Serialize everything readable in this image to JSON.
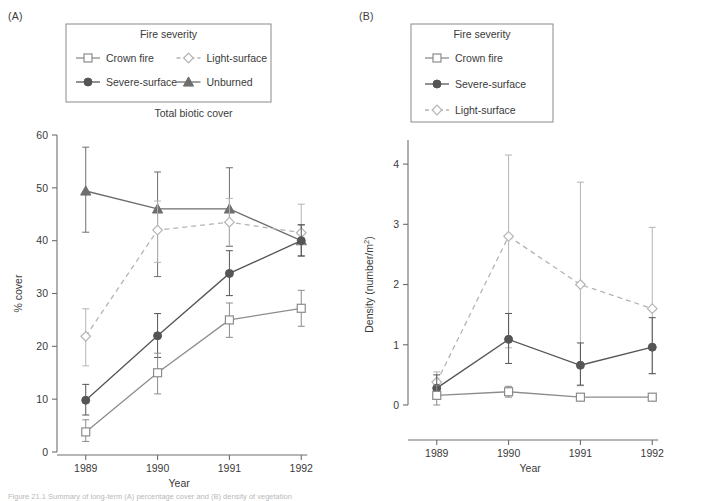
{
  "figure": {
    "caption": "Figure 21.1  Summary of long-term (A) percentage cover and (B) density of vegetation"
  },
  "panels": [
    {
      "tag": "(A)",
      "legend_title": "Fire severity",
      "legend_layout": "two-column",
      "legend_entries": [
        {
          "label": "Crown fire",
          "marker": "open-square",
          "line": "solid",
          "color": "#8c8c8c"
        },
        {
          "label": "Light-surface",
          "marker": "open-diamond",
          "line": "dashed",
          "color": "#b4b4b4"
        },
        {
          "label": "Severe-surface",
          "marker": "filled-circle",
          "line": "solid",
          "color": "#555555"
        },
        {
          "label": "Unburned",
          "marker": "filled-triangle",
          "line": "solid",
          "color": "#6e6e6e"
        }
      ],
      "chart_data": {
        "type": "line",
        "title": "Total biotic cover",
        "xlabel": "Year",
        "ylabel": "% cover",
        "categories": [
          "1989",
          "1990",
          "1991",
          "1992"
        ],
        "x": [
          1989,
          1990,
          1991,
          1992
        ],
        "xlim": [
          1988.6,
          1992.4
        ],
        "ylim": [
          0,
          60
        ],
        "yticks": [
          0,
          10,
          20,
          30,
          40,
          50,
          60
        ],
        "grid": false,
        "legend_position": "above-plot",
        "series": [
          {
            "name": "Unburned",
            "marker": "filled-triangle",
            "line": "solid",
            "color": "#6e6e6e",
            "values": [
              49.4,
              46.0,
              46.0,
              40.0
            ],
            "err_low": [
              41.6,
              33.2,
              38.9,
              37.1
            ],
            "err_high": [
              57.7,
              53.0,
              53.8,
              43.0
            ]
          },
          {
            "name": "Light-surface",
            "marker": "open-diamond",
            "line": "dashed",
            "color": "#b4b4b4",
            "values": [
              21.9,
              42.0,
              43.5,
              41.5
            ],
            "err_low": [
              16.3,
              35.9,
              39.0,
              39.3
            ],
            "err_high": [
              27.1,
              47.5,
              48.0,
              46.9
            ]
          },
          {
            "name": "Severe-surface",
            "marker": "filled-circle",
            "line": "solid",
            "color": "#555555",
            "values": [
              9.8,
              22.0,
              33.8,
              40.0
            ],
            "err_low": [
              7.0,
              17.9,
              29.6,
              37.1
            ],
            "err_high": [
              12.8,
              26.2,
              38.1,
              43.0
            ]
          },
          {
            "name": "Crown fire",
            "marker": "open-square",
            "line": "solid",
            "color": "#8c8c8c",
            "values": [
              3.8,
              15.0,
              25.0,
              27.2
            ],
            "err_low": [
              2.0,
              11.0,
              21.7,
              23.8
            ],
            "err_high": [
              6.1,
              18.7,
              28.2,
              30.6
            ]
          }
        ]
      }
    },
    {
      "tag": "(B)",
      "legend_title": "Fire severity",
      "legend_layout": "one-column",
      "legend_entries": [
        {
          "label": "Crown fire",
          "marker": "open-square",
          "line": "solid",
          "color": "#8c8c8c"
        },
        {
          "label": "Severe-surface",
          "marker": "filled-circle",
          "line": "solid",
          "color": "#555555"
        },
        {
          "label": "Light-surface",
          "marker": "open-diamond",
          "line": "dashed",
          "color": "#b4b4b4"
        }
      ],
      "chart_data": {
        "type": "line",
        "title": "",
        "xlabel": "Year",
        "ylabel": "Density (number/m2)",
        "ylabel_display": "Density (number/m",
        "ylabel_superscript": "2",
        "ylabel_suffix": ")",
        "categories": [
          "1989",
          "1990",
          "1991",
          "1992"
        ],
        "x": [
          1989,
          1990,
          1991,
          1992
        ],
        "xlim": [
          1988.6,
          1992.4
        ],
        "ylim": [
          0,
          4.4
        ],
        "yticks": [
          0,
          1,
          2,
          3,
          4
        ],
        "grid": false,
        "legend_position": "above-plot",
        "series": [
          {
            "name": "Light-surface",
            "marker": "open-diamond",
            "line": "dashed",
            "color": "#b4b4b4",
            "values": [
              0.38,
              2.8,
              2.0,
              1.6
            ],
            "err_low": [
              0.22,
              0.95,
              0.32,
              0.52
            ],
            "err_high": [
              0.55,
              4.15,
              3.7,
              2.95
            ]
          },
          {
            "name": "Severe-surface",
            "marker": "filled-circle",
            "line": "solid",
            "color": "#555555",
            "values": [
              0.28,
              1.09,
              0.66,
              0.96
            ],
            "err_low": [
              0.13,
              0.69,
              0.33,
              0.52
            ],
            "err_high": [
              0.5,
              1.52,
              1.03,
              1.45
            ]
          },
          {
            "name": "Crown fire",
            "marker": "open-square",
            "line": "solid",
            "color": "#8c8c8c",
            "values": [
              0.16,
              0.22,
              0.13,
              0.13
            ],
            "err_low": [
              0.0,
              0.13,
              0.07,
              0.07
            ],
            "err_high": [
              0.33,
              0.31,
              0.19,
              0.19
            ]
          }
        ]
      }
    }
  ]
}
